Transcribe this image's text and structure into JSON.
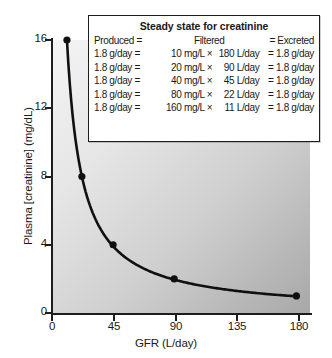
{
  "chart_data": {
    "type": "line",
    "title": "",
    "xlabel": "GFR (L/day)",
    "ylabel": "Plasma [creatinine] (mg/dL)",
    "xlim": [
      0,
      190
    ],
    "ylim": [
      0,
      16
    ],
    "xticks": [
      0,
      45,
      90,
      135,
      180
    ],
    "yticks": [
      0,
      4,
      8,
      12,
      16
    ],
    "grid": false,
    "legend_position": "top-right-inset",
    "markers": true,
    "series": [
      {
        "name": "Plasma creatinine vs GFR",
        "x": [
          11,
          22,
          45,
          90,
          180
        ],
        "y": [
          16,
          8,
          4,
          2,
          1
        ]
      }
    ],
    "points": [
      {
        "x": 11,
        "y": 16
      },
      {
        "x": 22,
        "y": 8
      },
      {
        "x": 45,
        "y": 4
      },
      {
        "x": 90,
        "y": 2
      },
      {
        "x": 180,
        "y": 1
      }
    ],
    "annotation": "Plasma creatinine concentration is inversely proportional to GFR at steady state; excretion equals production of 1.8 g/day."
  },
  "table": {
    "title": "Steady state for creatinine",
    "header": {
      "produced": "Produced =",
      "filtered": "Filtered",
      "excreted": "= Excreted"
    },
    "rows": [
      {
        "produced": "1.8 g/day =",
        "conc": "10 mg/L",
        "times": "×",
        "flow": "180 L/day",
        "excreted": "= 1.8 g/day"
      },
      {
        "produced": "1.8 g/day =",
        "conc": "20 mg/L",
        "times": "×",
        "flow": "90 L/day",
        "excreted": "= 1.8 g/day"
      },
      {
        "produced": "1.8 g/day =",
        "conc": "40 mg/L",
        "times": "×",
        "flow": "45 L/day",
        "excreted": "= 1.8 g/day"
      },
      {
        "produced": "1.8 g/day =",
        "conc": "80 mg/L",
        "times": "×",
        "flow": "22 L/day",
        "excreted": "= 1.8 g/day"
      },
      {
        "produced": "1.8 g/day =",
        "conc": "160 mg/L",
        "times": "×",
        "flow": "11 L/day",
        "excreted": "= 1.8 g/day"
      }
    ]
  },
  "axes": {
    "y_labels": [
      "16",
      "12",
      "8",
      "4",
      "0"
    ],
    "x_labels": [
      "0",
      "45",
      "90",
      "135",
      "180"
    ],
    "y_title": "Plasma [creatinine] (mg/dL)",
    "x_title": "GFR (L/day)"
  },
  "colors": {
    "curve": "#101010",
    "axis": "#1d1d1d",
    "plot_bg_light": "#f4f4f4",
    "plot_bg_dark": "#a8a8a8",
    "box_bg": "#ffffff",
    "text": "#1a1a1a"
  }
}
